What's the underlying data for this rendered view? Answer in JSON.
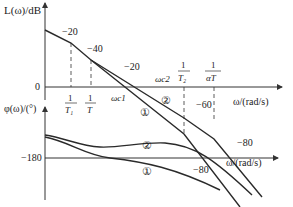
{
  "magnitude_plot": {
    "ylabel": "L(ω)/dB",
    "xlabel": "ω/(rad/s)",
    "zero_label": "0",
    "break_labels": {
      "t1": {
        "num": "1",
        "den": "T₁"
      },
      "t": {
        "num": "1",
        "den": "T"
      },
      "t2": {
        "num": "1",
        "den": "T₂"
      },
      "at": {
        "num": "1",
        "den": "αT"
      }
    },
    "crossover_labels": {
      "wc1": "ωc1",
      "wc2": "ωc2"
    },
    "slope_labels": [
      "−20",
      "−40",
      "−20",
      "−60",
      "−60",
      "−80"
    ],
    "curve_labels": {
      "c1": "①",
      "c2": "②"
    }
  },
  "phase_plot": {
    "ylabel": "φ(ω)/(°)",
    "xlabel": "ω/(rad/s)",
    "ref_label": "−180",
    "curve_labels": {
      "c1": "①",
      "c2": "②"
    },
    "slope_label": "−80"
  }
}
